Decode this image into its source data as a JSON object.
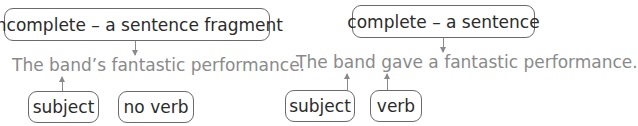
{
  "left_example": {
    "label": "incomplete – a sentence fragment",
    "sentence": "The band’s fantastic performance.",
    "tags": [
      "subject",
      "no verb"
    ]
  },
  "right_example": {
    "label": "complete – a sentence",
    "sentence": "The band gave a fantastic performance.",
    "tags": [
      "subject",
      "verb"
    ]
  },
  "colors": {
    "box_border": "#6a6a6a",
    "box_text": "#2b2b2b",
    "sentence_text": "#8a8a8a",
    "arrow": "#8a8a8a"
  }
}
